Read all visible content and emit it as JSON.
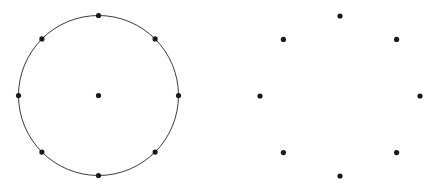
{
  "canvas": {
    "width": 433,
    "height": 188,
    "background": "#ffffff"
  },
  "style": {
    "dot_color": "#1a1a1a",
    "dot_radius": 2.6,
    "circle_stroke_color": "#3c3c3c",
    "circle_stroke_width": 1
  },
  "chart_data": {
    "type": "scatter",
    "title": "",
    "subtitle": "",
    "xlabel": "",
    "ylabel": "",
    "xlim": [
      0,
      433
    ],
    "ylim": [
      0,
      188
    ],
    "grid": false,
    "axes_visible": false,
    "legend": null,
    "annotations": [],
    "shapes": [
      {
        "name": "left-circle-outline",
        "type": "circle",
        "cx": 98.5,
        "cy": 95.5,
        "r": 80.0,
        "stroke": "#3c3c3c",
        "stroke_width": 1,
        "fill": "none"
      }
    ],
    "series": [
      {
        "name": "left-ring-points",
        "marker": "dot",
        "color": "#1a1a1a",
        "points": [
          {
            "label": "top",
            "angle_deg": 90,
            "x": 98.5,
            "y": 15.5
          },
          {
            "label": "upper-right",
            "angle_deg": 45,
            "x": 155.1,
            "y": 38.9
          },
          {
            "label": "right",
            "angle_deg": 0,
            "x": 178.5,
            "y": 95.5
          },
          {
            "label": "lower-right",
            "angle_deg": 315,
            "x": 155.1,
            "y": 152.1
          },
          {
            "label": "bottom",
            "angle_deg": 270,
            "x": 98.5,
            "y": 175.5
          },
          {
            "label": "lower-left",
            "angle_deg": 225,
            "x": 41.9,
            "y": 152.1
          },
          {
            "label": "left",
            "angle_deg": 180,
            "x": 18.5,
            "y": 95.5
          },
          {
            "label": "upper-left",
            "angle_deg": 135,
            "x": 41.9,
            "y": 38.9
          }
        ]
      },
      {
        "name": "left-center-point",
        "marker": "dot",
        "color": "#1a1a1a",
        "points": [
          {
            "label": "center",
            "angle_deg": null,
            "x": 98.5,
            "y": 95.5
          }
        ]
      },
      {
        "name": "right-ring-points",
        "marker": "dot",
        "color": "#1a1a1a",
        "points": [
          {
            "label": "top",
            "angle_deg": 90,
            "x": 340.0,
            "y": 16.0
          },
          {
            "label": "upper-right",
            "angle_deg": 45,
            "x": 396.6,
            "y": 39.4
          },
          {
            "label": "right",
            "angle_deg": 0,
            "x": 420.0,
            "y": 96.0
          },
          {
            "label": "lower-right",
            "angle_deg": 315,
            "x": 396.6,
            "y": 152.6
          },
          {
            "label": "bottom",
            "angle_deg": 270,
            "x": 340.0,
            "y": 176.0
          },
          {
            "label": "lower-left",
            "angle_deg": 225,
            "x": 283.4,
            "y": 152.6
          },
          {
            "label": "left",
            "angle_deg": 180,
            "x": 260.0,
            "y": 96.0
          },
          {
            "label": "upper-left",
            "angle_deg": 135,
            "x": 283.4,
            "y": 39.4
          }
        ]
      }
    ]
  }
}
